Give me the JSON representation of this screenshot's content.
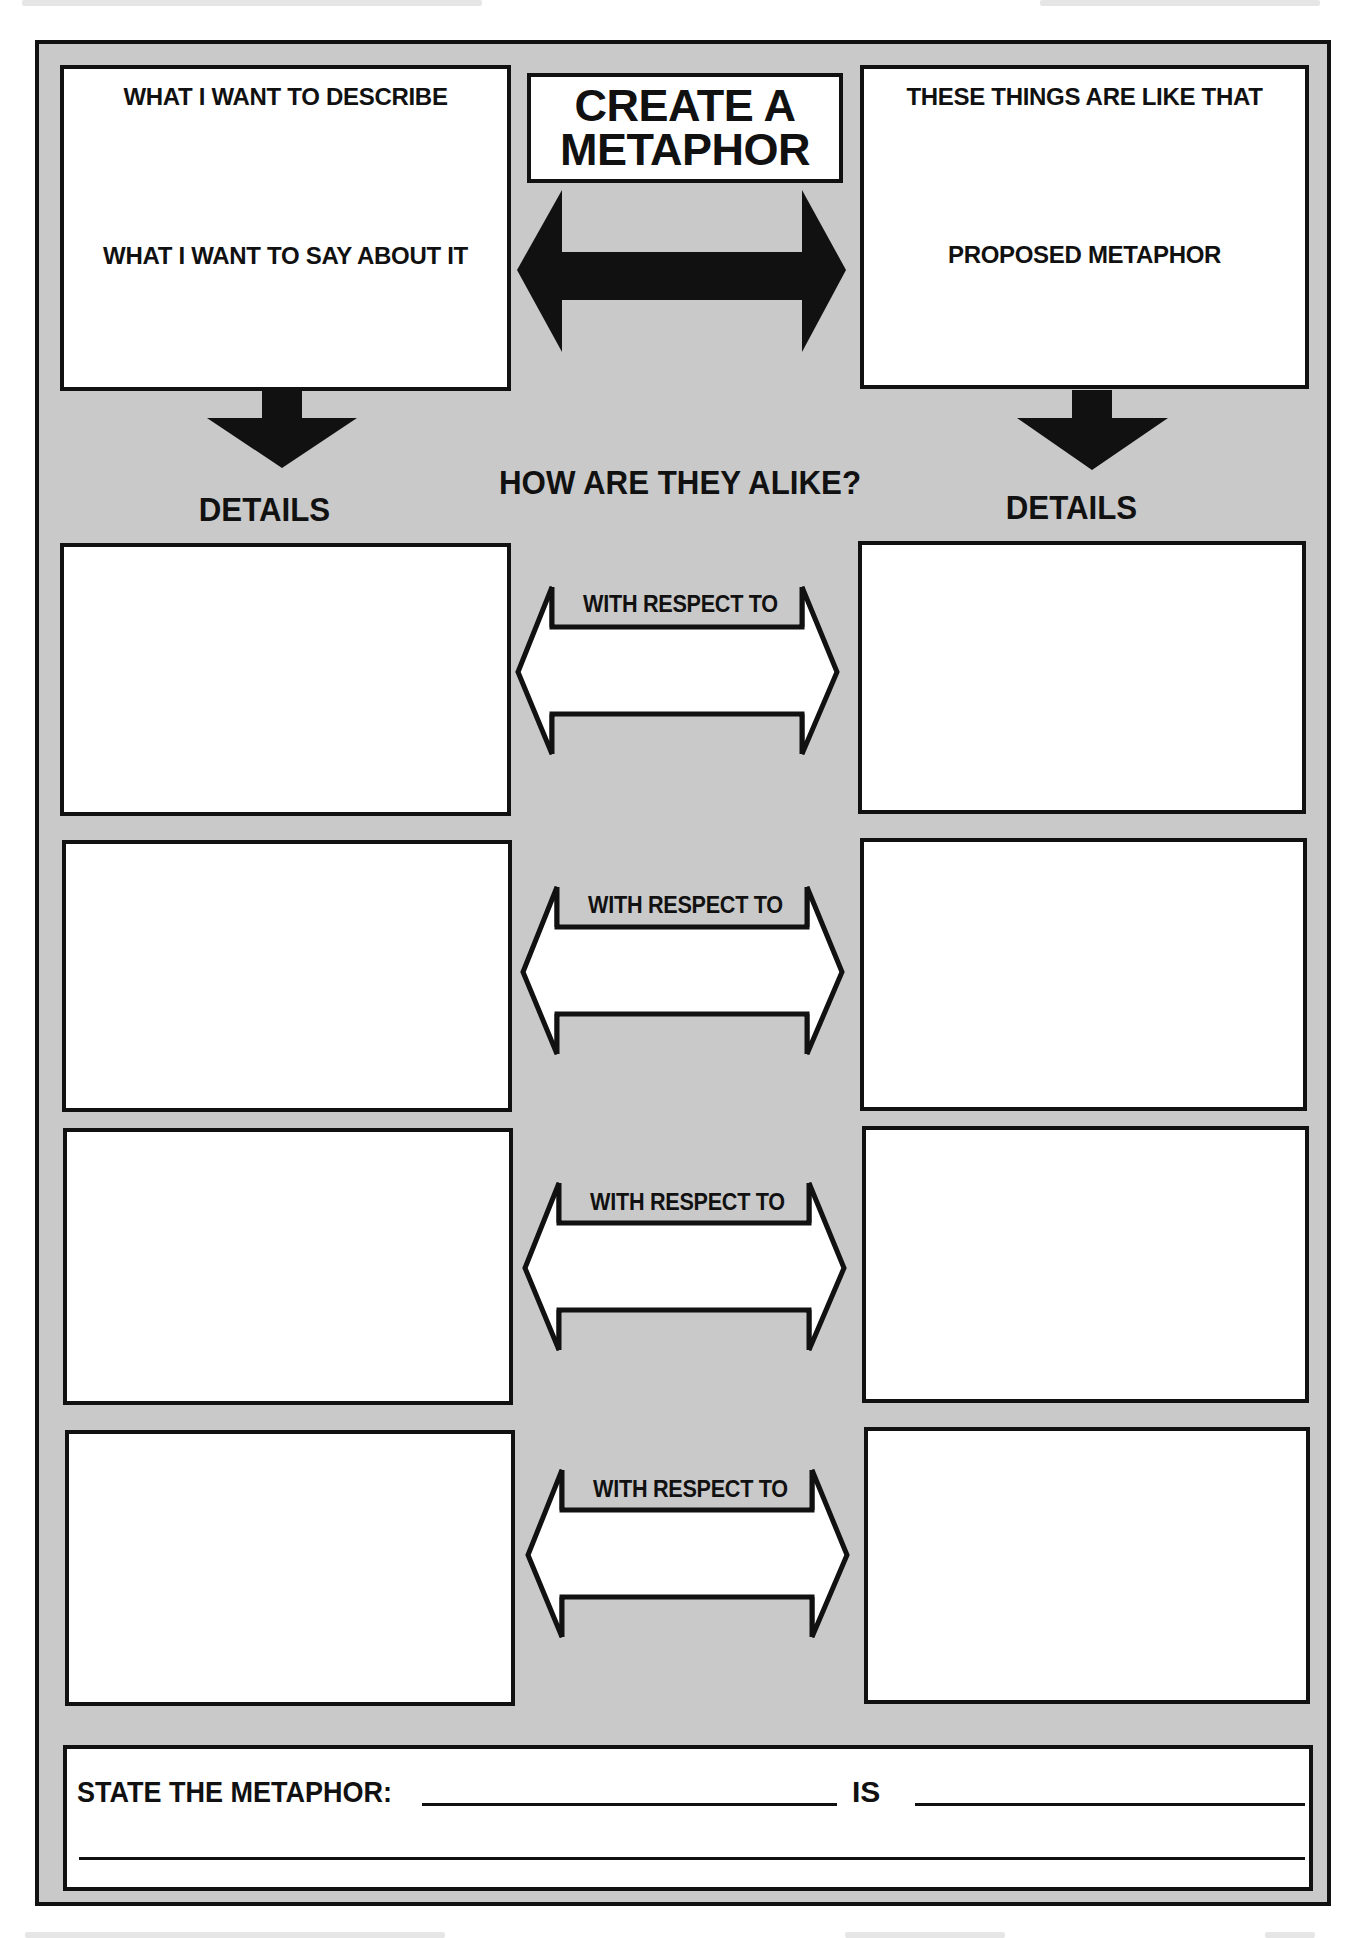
{
  "worksheet": {
    "title_lines": [
      "CREATE A",
      "METAPHOR"
    ],
    "top_left_box": {
      "heading": "WHAT I WANT TO DESCRIBE",
      "subheading": "WHAT I WANT TO SAY ABOUT IT"
    },
    "top_right_box": {
      "heading": "THESE THINGS ARE LIKE THAT",
      "subheading": "PROPOSED METAPHOR"
    },
    "center_heading": "HOW ARE THEY ALIKE?",
    "left_column_heading": "DETAILS",
    "right_column_heading": "DETAILS",
    "comparison_rows": [
      {
        "connector_label": "WITH RESPECT TO",
        "left_detail": "",
        "right_detail": ""
      },
      {
        "connector_label": "WITH RESPECT TO",
        "left_detail": "",
        "right_detail": ""
      },
      {
        "connector_label": "WITH RESPECT TO",
        "left_detail": "",
        "right_detail": ""
      },
      {
        "connector_label": "WITH RESPECT TO",
        "left_detail": "",
        "right_detail": ""
      }
    ],
    "statement": {
      "label": "STATE THE METAPHOR:",
      "connector": "IS",
      "first_blank": "",
      "second_blank": "",
      "third_blank": ""
    }
  },
  "colors": {
    "panel_fill": "#c9c9c9",
    "ink": "#111111",
    "box_fill": "#ffffff"
  }
}
